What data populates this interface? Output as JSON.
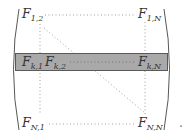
{
  "matrix": {
    "entries": {
      "top_left": {
        "base": "F",
        "sub": "1,2"
      },
      "top_right": {
        "base": "F",
        "sub": "1,N"
      },
      "row_k_col1": {
        "base": "F",
        "sub": "k,1"
      },
      "row_k_col2": {
        "base": "F",
        "sub": "k,2"
      },
      "row_k_colN": {
        "base": "F",
        "sub": "k,N"
      },
      "bottom_left": {
        "base": "F",
        "sub": "N,1"
      },
      "bottom_right": {
        "base": "F",
        "sub": "N,N"
      }
    },
    "highlighted_row": "k",
    "trailing_punctuation": "."
  },
  "colors": {
    "band_fill": "#a9a9a9",
    "band_border": "#5a5a5a",
    "text": "#333333",
    "dots": "#888888",
    "bracket": "#444444"
  }
}
